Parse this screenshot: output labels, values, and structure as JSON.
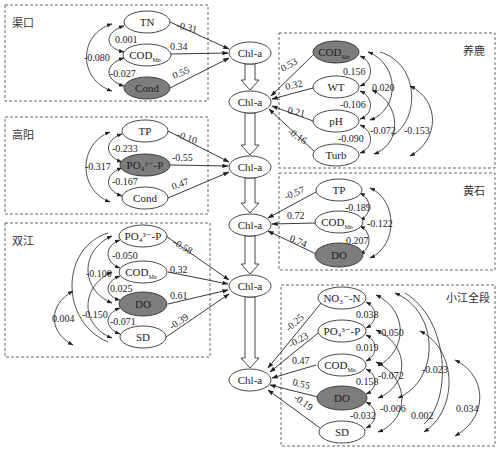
{
  "diagram": {
    "type": "path-analysis",
    "target_variable": "Chl-a",
    "chl_nodes": [
      {
        "id": "chl1",
        "label": "Chl-a",
        "cx": 250,
        "cy": 53
      },
      {
        "id": "chl2",
        "label": "Chl-a",
        "cx": 250,
        "cy": 102
      },
      {
        "id": "chl3",
        "label": "Chl-a",
        "cx": 250,
        "cy": 167
      },
      {
        "id": "chl4",
        "label": "Chl-a",
        "cx": 250,
        "cy": 225
      },
      {
        "id": "chl5",
        "label": "Chl-a",
        "cx": 250,
        "cy": 286
      },
      {
        "id": "chl6",
        "label": "Chl-a",
        "cx": 250,
        "cy": 380
      }
    ],
    "regions": [
      {
        "name": "渠口",
        "side": "left",
        "target": "chl1",
        "variables": [
          {
            "label": "TN",
            "highlighted": false,
            "path_coef": "-0.31"
          },
          {
            "label": "COD",
            "sub": "Mn",
            "highlighted": false,
            "path_coef": "0.34"
          },
          {
            "label": "Cond",
            "highlighted": true,
            "path_coef": "0.55"
          }
        ],
        "correlations": [
          {
            "from": "TN",
            "to": "COD_Mn",
            "value": "0.001"
          },
          {
            "from": "COD_Mn",
            "to": "Cond",
            "value": "-0.027"
          },
          {
            "from": "TN",
            "to": "Cond",
            "value": "-0.080"
          }
        ]
      },
      {
        "name": "高阳",
        "side": "left",
        "target": "chl3",
        "variables": [
          {
            "label": "TP",
            "highlighted": false,
            "path_coef": "-0.10"
          },
          {
            "label": "PO₄³⁻-P",
            "highlighted": true,
            "path_coef": "-0.55"
          },
          {
            "label": "Cond",
            "highlighted": false,
            "path_coef": "0.47"
          }
        ],
        "correlations": [
          {
            "from": "TP",
            "to": "PO4-P",
            "value": "-0.233"
          },
          {
            "from": "PO4-P",
            "to": "Cond",
            "value": "-0.167"
          },
          {
            "from": "TP",
            "to": "Cond",
            "value": "-0.317"
          }
        ]
      },
      {
        "name": "双江",
        "side": "left",
        "target": "chl5",
        "variables": [
          {
            "label": "PO₄³⁻-P",
            "highlighted": false,
            "path_coef": "-0.58"
          },
          {
            "label": "COD",
            "sub": "Mn",
            "highlighted": false,
            "path_coef": "0.32"
          },
          {
            "label": "DO",
            "highlighted": true,
            "path_coef": "0.61"
          },
          {
            "label": "SD",
            "highlighted": false,
            "path_coef": "-0.39"
          }
        ],
        "correlations": [
          {
            "from": "PO4-P",
            "to": "COD_Mn",
            "value": "-0.050"
          },
          {
            "from": "COD_Mn",
            "to": "DO",
            "value": "0.025"
          },
          {
            "from": "DO",
            "to": "SD",
            "value": "-0.071"
          },
          {
            "from": "PO4-P",
            "to": "DO",
            "value": "-0.100"
          },
          {
            "from": "COD_Mn",
            "to": "SD",
            "value": "-0.150"
          },
          {
            "from": "PO4-P",
            "to": "SD",
            "value": "0.004"
          }
        ]
      },
      {
        "name": "养鹿",
        "side": "right",
        "target": "chl2",
        "variables": [
          {
            "label": "COD",
            "sub": "Mn",
            "highlighted": true,
            "path_coef": "0.53"
          },
          {
            "label": "WT",
            "highlighted": false,
            "path_coef": "0.32"
          },
          {
            "label": "pH",
            "highlighted": false,
            "path_coef": "0.21"
          },
          {
            "label": "Turb",
            "highlighted": false,
            "path_coef": "-0.16"
          }
        ],
        "correlations": [
          {
            "from": "COD_Mn",
            "to": "WT",
            "value": "0.156"
          },
          {
            "from": "WT",
            "to": "pH",
            "value": "-0.106"
          },
          {
            "from": "pH",
            "to": "Turb",
            "value": "-0.090"
          },
          {
            "from": "COD_Mn",
            "to": "pH",
            "value": "0.020"
          },
          {
            "from": "WT",
            "to": "Turb",
            "value": "-0.072"
          },
          {
            "from": "COD_Mn",
            "to": "Turb",
            "value": "-0.153"
          }
        ]
      },
      {
        "name": "黄石",
        "side": "right",
        "target": "chl4",
        "variables": [
          {
            "label": "TP",
            "highlighted": false,
            "path_coef": "-0.57"
          },
          {
            "label": "COD",
            "sub": "Mn",
            "highlighted": false,
            "path_coef": "0.72"
          },
          {
            "label": "DO",
            "highlighted": true,
            "path_coef": "0.74"
          }
        ],
        "correlations": [
          {
            "from": "TP",
            "to": "COD_Mn",
            "value": "-0.189"
          },
          {
            "from": "COD_Mn",
            "to": "DO",
            "value": "0.207"
          },
          {
            "from": "TP",
            "to": "DO",
            "value": "-0.122"
          }
        ]
      },
      {
        "name": "小江全段",
        "side": "right",
        "target": "chl6",
        "variables": [
          {
            "label": "NO₃⁻-N",
            "highlighted": false,
            "path_coef": "-0.25"
          },
          {
            "label": "PO₄³⁻-P",
            "highlighted": false,
            "path_coef": "-0.23"
          },
          {
            "label": "COD",
            "sub": "Mn",
            "highlighted": false,
            "path_coef": "0.47"
          },
          {
            "label": "DO",
            "highlighted": true,
            "path_coef": "0.55"
          },
          {
            "label": "SD",
            "highlighted": false,
            "path_coef": "-0.19"
          }
        ],
        "correlations": [
          {
            "from": "NO3-N",
            "to": "PO4-P",
            "value": "0.038"
          },
          {
            "from": "PO4-P",
            "to": "COD_Mn",
            "value": "0.019"
          },
          {
            "from": "COD_Mn",
            "to": "DO",
            "value": "0.158"
          },
          {
            "from": "DO",
            "to": "SD",
            "value": "-0.032"
          },
          {
            "from": "NO3-N",
            "to": "COD_Mn",
            "value": "-0.050"
          },
          {
            "from": "PO4-P",
            "to": "DO",
            "value": "-0.072"
          },
          {
            "from": "COD_Mn",
            "to": "SD",
            "value": "-0.006"
          },
          {
            "from": "NO3-N",
            "to": "DO",
            "value": "-0.023"
          },
          {
            "from": "PO4-P",
            "to": "SD",
            "value": "0.002"
          },
          {
            "from": "NO3-N",
            "to": "SD",
            "value": "0.034"
          }
        ]
      }
    ]
  }
}
